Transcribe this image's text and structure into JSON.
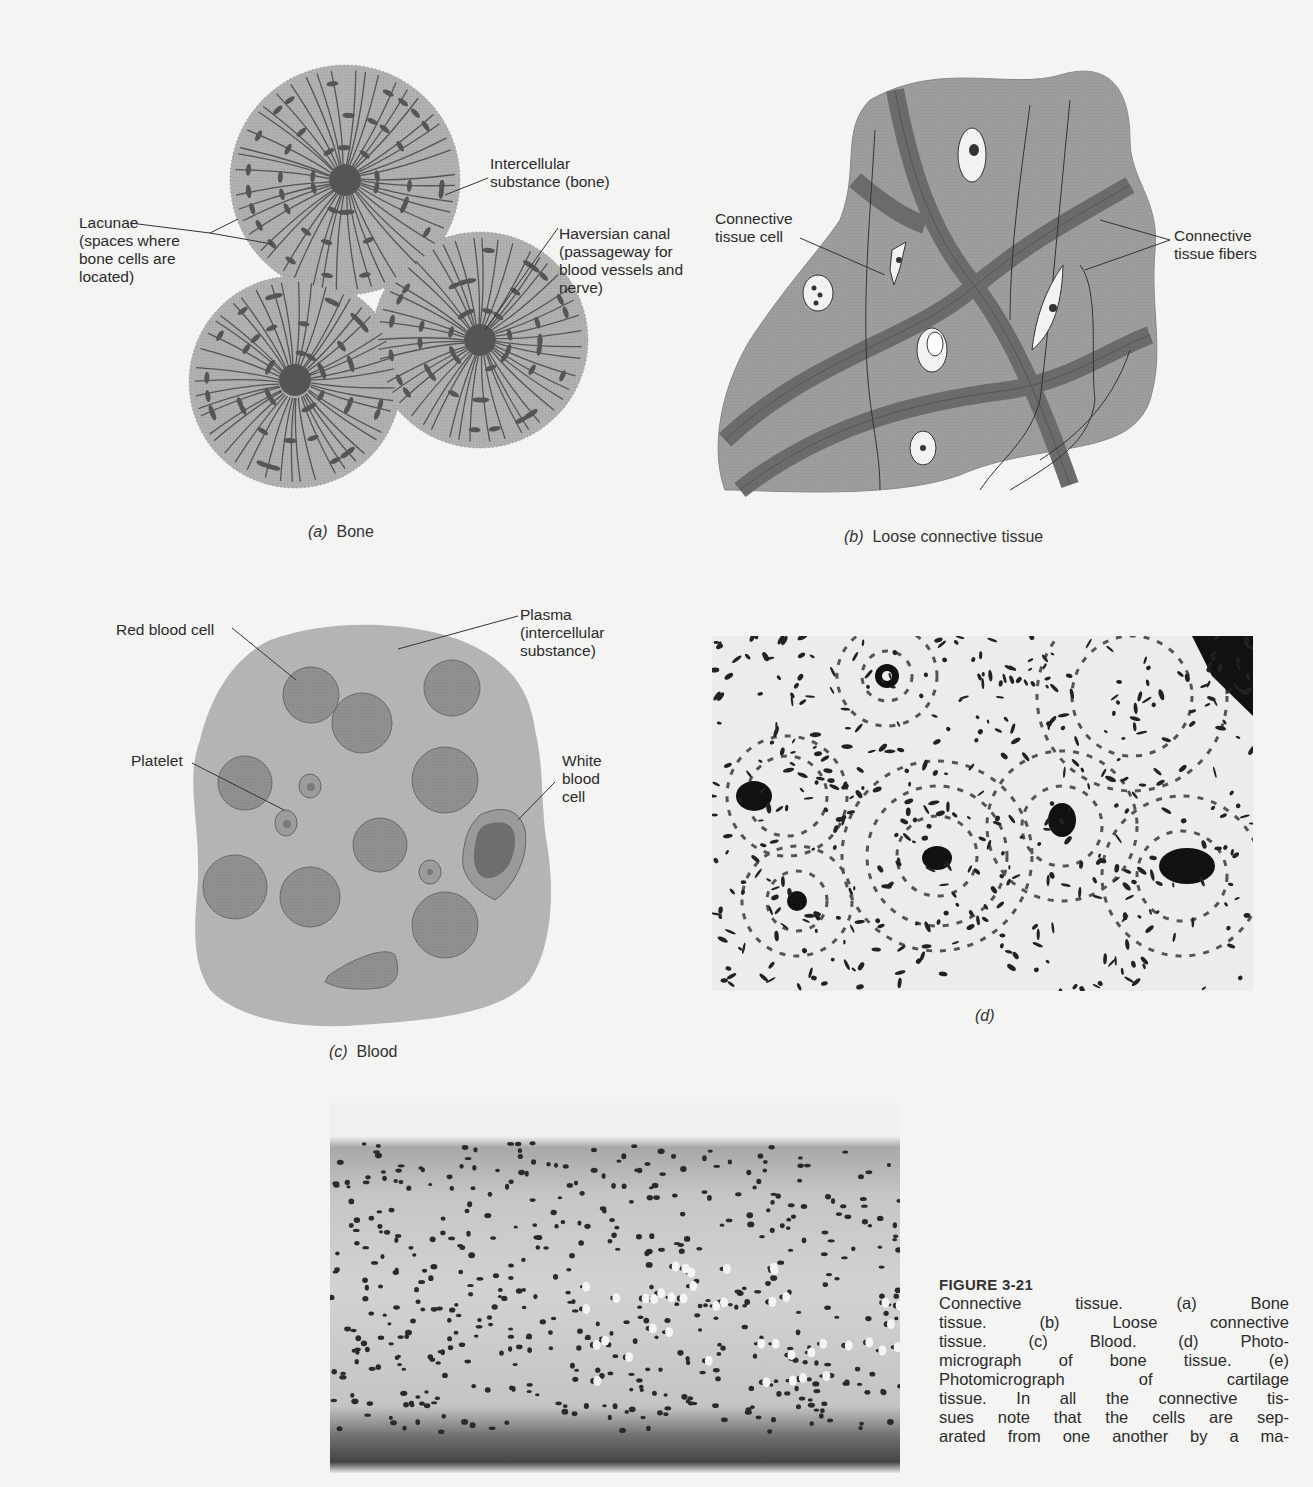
{
  "panels": {
    "a": {
      "letter": "(a)",
      "title": "Bone",
      "labels": {
        "lacunae": "Lacunae\n(spaces where\nbone cells are\nlocated)",
        "intercellular": "Intercellular\nsubstance (bone)",
        "haversian": "Haversian canal\n(passageway for\nblood vessels and\nnerve)"
      }
    },
    "b": {
      "letter": "(b)",
      "title": "Loose connective tissue",
      "labels": {
        "cell": "Connective\ntissue cell",
        "fibers": "Connective\ntissue fibers"
      }
    },
    "c": {
      "letter": "(c)",
      "title": "Blood",
      "labels": {
        "rbc": "Red blood cell",
        "plasma": "Plasma\n(intercellular\nsubstance)",
        "platelet": "Platelet",
        "wbc": "White\nblood\ncell"
      }
    },
    "d": {
      "letter": "(d)",
      "title": ""
    },
    "e": {
      "letter": "(e)",
      "title": ""
    }
  },
  "figure": {
    "number": "FIGURE 3-21",
    "caption_lines": [
      "Connective tissue. (a) Bone",
      "tissue. (b) Loose connective",
      "tissue. (c) Blood. (d) Photo-",
      "micrograph of bone tissue. (e)",
      "Photomicrograph of cartilage",
      "tissue. In all the connective tis-",
      "sues note that the cells are sep-",
      "arated from one another by a ma-"
    ]
  },
  "colors": {
    "page": "#f4f4f2",
    "tissue_fill": "#a9a9a9",
    "blood_fill": "#b2b2b2",
    "cell_fill": "#8e8e8e",
    "dark": "#5a5a5a"
  }
}
